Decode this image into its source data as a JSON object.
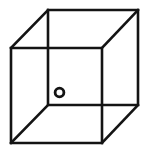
{
  "figure": {
    "name": "necker-cube-with-marker",
    "background_color": "#ffffff",
    "line_color": "#141414",
    "line_width": 2.6,
    "canvas": {
      "width": 150,
      "height": 153
    }
  },
  "geometry": {
    "front_face": {
      "label": "front square face",
      "points": "11,48 102,48 102,143 11,143",
      "vertices": [
        {
          "name": "front-top-left",
          "x": 11,
          "y": 48
        },
        {
          "name": "front-top-right",
          "x": 102,
          "y": 48
        },
        {
          "name": "front-bottom-right",
          "x": 102,
          "y": 143
        },
        {
          "name": "front-bottom-left",
          "x": 11,
          "y": 143
        }
      ]
    },
    "back_face": {
      "label": "back square face",
      "points": "48,10 138,10 138,105 48,105",
      "vertices": [
        {
          "name": "back-top-left",
          "x": 48,
          "y": 10
        },
        {
          "name": "back-top-right",
          "x": 138,
          "y": 10
        },
        {
          "name": "back-bottom-right",
          "x": 138,
          "y": 105
        },
        {
          "name": "back-bottom-left",
          "x": 48,
          "y": 105
        }
      ]
    },
    "connecting_edges": [
      {
        "name": "edge-top-left",
        "x1": 11,
        "y1": 48,
        "x2": 48,
        "y2": 10
      },
      {
        "name": "edge-top-right",
        "x1": 102,
        "y1": 48,
        "x2": 138,
        "y2": 10
      },
      {
        "name": "edge-bottom-right",
        "x1": 102,
        "y1": 143,
        "x2": 138,
        "y2": 105
      },
      {
        "name": "edge-bottom-left",
        "x1": 11,
        "y1": 143,
        "x2": 48,
        "y2": 105
      }
    ]
  },
  "marker": {
    "name": "circle-marker",
    "shape": "open-circle",
    "cx": 59.5,
    "cy": 92.5,
    "r": 4.4,
    "stroke_width": 2.8,
    "fill": "none",
    "stroke": "#141414"
  },
  "labels": {
    "caption": "",
    "annotations": []
  }
}
